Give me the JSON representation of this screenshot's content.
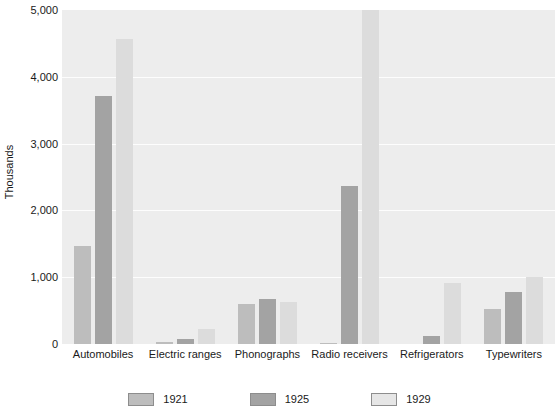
{
  "chart_data": {
    "type": "bar",
    "title": "",
    "subtitle": "",
    "xlabel": "",
    "ylabel": "Thousands",
    "ylim": [
      0,
      5000
    ],
    "yticks": [
      0,
      1000,
      2000,
      3000,
      4000,
      5000
    ],
    "ytick_labels": [
      "0",
      "1,000",
      "2,000",
      "3,000",
      "4,000",
      "5,000"
    ],
    "grid": true,
    "legend_position": "bottom",
    "categories": [
      "Automobiles",
      "Electric ranges",
      "Phonographs",
      "Radio receivers",
      "Refrigerators",
      "Typewriters"
    ],
    "series": [
      {
        "name": "1921",
        "color": "#bdbdbd",
        "values": [
          1470,
          30,
          600,
          10,
          5,
          520
        ]
      },
      {
        "name": "1925",
        "color": "#a3a3a3",
        "values": [
          3710,
          80,
          680,
          2370,
          120,
          780
        ]
      },
      {
        "name": "1929",
        "color": "#dcdcdc",
        "values": [
          4570,
          230,
          630,
          5000,
          920,
          1000
        ]
      }
    ],
    "annotations": []
  },
  "axis": {
    "y_title": "Thousands"
  },
  "legend": {
    "items": [
      {
        "label": "1921",
        "swatch_class": "y1921"
      },
      {
        "label": "1925",
        "swatch_class": "y1925"
      },
      {
        "label": "1929",
        "swatch_class": "y1929"
      }
    ]
  },
  "colors": {
    "plot_background": "#ededed",
    "gridline": "#fdfdfd",
    "series_1921": "#bdbdbd",
    "series_1925": "#a3a3a3",
    "series_1929": "#dcdcdc",
    "text": "#1a1a1a"
  }
}
